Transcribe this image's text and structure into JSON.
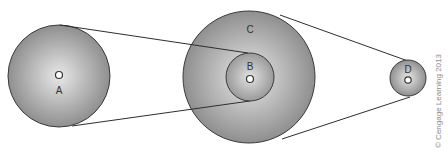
{
  "diagram": {
    "type": "pulley-belt-system",
    "pulleys": [
      {
        "id": "A",
        "label": "A",
        "cx": 59,
        "cy": 76,
        "r": 51
      },
      {
        "id": "C",
        "label": "C",
        "cx": 249,
        "cy": 77,
        "r": 66
      },
      {
        "id": "B",
        "label": "B",
        "cx": 250,
        "cy": 77,
        "r": 24
      },
      {
        "id": "D",
        "label": "D",
        "cx": 408,
        "cy": 78,
        "r": 18
      }
    ],
    "belts": [
      {
        "from": "A",
        "to": "B"
      },
      {
        "from": "C",
        "to": "D"
      }
    ],
    "colors": {
      "pulley_center": "#e6e6e6",
      "pulley_edge": "#8c8c8c",
      "outline": "#3a3a3a",
      "belt": "#2e2e2e"
    },
    "credit": "© Cengage Learning 2013"
  }
}
